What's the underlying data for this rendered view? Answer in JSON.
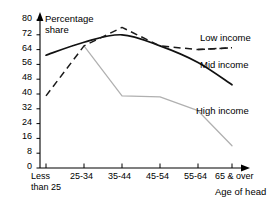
{
  "chart_data": {
    "type": "line",
    "title": "",
    "xlabel": "Age of head",
    "ylabel": "Percentage share",
    "ylabel_line1": "Percentage",
    "ylabel_line2": "share",
    "categories": [
      "Less than 25",
      "25-34",
      "35-44",
      "45-54",
      "55-64",
      "65 & over"
    ],
    "category_lines": [
      [
        "Less",
        "than 25"
      ],
      [
        "25-34"
      ],
      [
        "35-44"
      ],
      [
        "45-54"
      ],
      [
        "55-64"
      ],
      [
        "65 & over"
      ]
    ],
    "ylim": [
      0,
      80
    ],
    "yticks": [
      0,
      8,
      16,
      24,
      32,
      40,
      48,
      56,
      64,
      72,
      80
    ],
    "grid": false,
    "legend_position": "inline-right",
    "series": [
      {
        "name": "Low income",
        "style": "dashed",
        "color": "#1a1a1a",
        "values": [
          39,
          66,
          76,
          66,
          64,
          65
        ]
      },
      {
        "name": "Mid income",
        "style": "solid",
        "color": "#111111",
        "values": [
          61,
          68,
          72,
          66,
          57,
          45
        ]
      },
      {
        "name": "High income",
        "style": "solid-light",
        "color": "#b0b0b0",
        "values": [
          null,
          66,
          39,
          38.5,
          31,
          12
        ]
      }
    ]
  },
  "axis": {
    "y_tick_labels": [
      "80",
      "72",
      "64",
      "56",
      "48",
      "40",
      "32",
      "24",
      "16",
      "8",
      "0"
    ],
    "x_title": "Age of head"
  },
  "legend": {
    "low": "Low income",
    "mid": "Mid income",
    "high": "High income"
  }
}
